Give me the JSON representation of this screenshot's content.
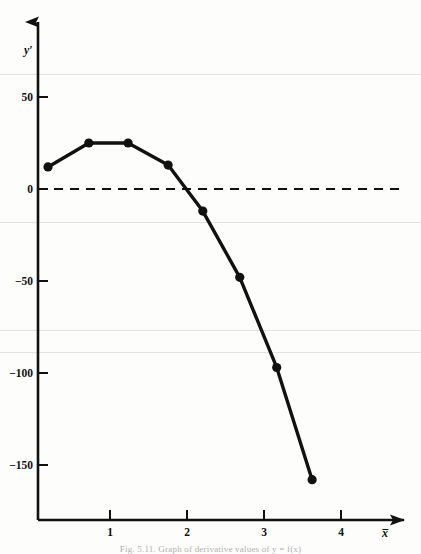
{
  "figure": {
    "caption": "Fig. 5.11.   Graph of derivative values of y = f(x)",
    "background_color": "#fdfdfc",
    "ink_color": "#111111"
  },
  "axes": {
    "y_axis_label": "y′",
    "x_axis_label": "x̅",
    "x_ticks": [
      "1",
      "2",
      "3",
      "4"
    ],
    "x_tick_values": [
      1,
      2,
      3,
      4
    ],
    "y_ticks": [
      "50",
      "0",
      "−50",
      "−100",
      "−150"
    ],
    "y_tick_values": [
      50,
      0,
      -50,
      -100,
      -150
    ],
    "zero_line_style": "dashed",
    "arrowheads": [
      "x-axis-right",
      "y-axis-up"
    ]
  },
  "chart_data": {
    "type": "line",
    "title": "",
    "subtitle": "",
    "xlabel": "x̅",
    "ylabel": "y′",
    "xlim": [
      0,
      4.55
    ],
    "ylim": [
      -180,
      72
    ],
    "grid": false,
    "legend": null,
    "markers": "filled-circle",
    "series": [
      {
        "name": "y′",
        "x": [
          0.13,
          0.66,
          1.17,
          1.69,
          2.14,
          2.62,
          3.1,
          3.56
        ],
        "values": [
          12,
          25,
          25,
          13,
          -12,
          -48,
          -97,
          -158
        ]
      }
    ],
    "annotations": [
      {
        "text": "zero reference line",
        "y": 0,
        "style": "dashed-horizontal"
      }
    ]
  }
}
